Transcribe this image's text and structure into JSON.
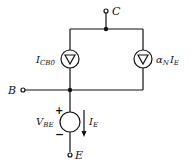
{
  "diagram": {
    "terminals": {
      "collector": {
        "main": "C"
      },
      "base": {
        "main": "B"
      },
      "emitter": {
        "main": "E"
      }
    },
    "sources": {
      "leakage": {
        "main": "I",
        "sub": "CB0",
        "type": "current-source"
      },
      "dependent": {
        "prefix": "α",
        "prefix_sub": "N",
        "main": "I",
        "sub": "E",
        "type": "current-source"
      },
      "vbe": {
        "main": "V",
        "sub": "BE",
        "type": "voltage-source",
        "plus": "+",
        "minus": "−"
      }
    },
    "current_arrow": {
      "main": "I",
      "sub": "E"
    },
    "colors": {
      "line": "#111111",
      "background": "#ffffff"
    }
  }
}
